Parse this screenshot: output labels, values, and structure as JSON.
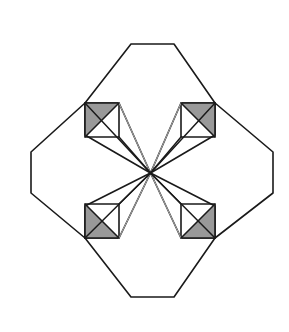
{
  "figure": {
    "canvas": {
      "width": 289,
      "height": 332,
      "background": "#ffffff"
    },
    "center": {
      "x": 150.5,
      "y": 173.0,
      "label": "center-point"
    },
    "colors": {
      "outline": "#1a1a1a",
      "shade_fill": "#999999",
      "shade_fill_light": "#a8a8a8",
      "axis_line": "#b0b0b0",
      "faint_ray": "#cfcfcf",
      "background": "#ffffff"
    },
    "stroke_widths": {
      "outline": 1.6,
      "ray": 1.5,
      "axis": 0.7,
      "faint_ray": 0.8
    },
    "symmetry": {
      "order": 4,
      "type": "4-fold rotational / bilateral"
    },
    "lobes": [
      {
        "name": "top-lobe",
        "outline_points": "131,44 174,44 215,103 181,103 150.5,173 119,103 85,103"
      },
      {
        "name": "right-lobe",
        "outline_points": "273,152 273,193 215,238 215,206 150.5,173 215,135 215,103"
      },
      {
        "name": "bottom-lobe",
        "outline_points": "174,297 131,297 85,238 119,238 150.5,173 181,238 215,238"
      },
      {
        "name": "left-lobe",
        "outline_points": "31,193 31,152 85,103 85,135 150.5,173 85,206 85,238"
      }
    ],
    "squares": [
      {
        "name": "square-top-left",
        "x": 85,
        "y": 103,
        "size": 34,
        "square_points": "85,103 119,103 119,137 85,137",
        "diagonal": "119,103 85,137",
        "shaded_triangle": "85,103 119,103 85,137",
        "shaded_corner": "upper-left"
      },
      {
        "name": "square-top-right",
        "x": 181,
        "y": 103,
        "size": 34,
        "square_points": "181,103 215,103 215,137 181,137",
        "diagonal": "181,103 215,137",
        "shaded_triangle": "181,103 215,103 215,137",
        "shaded_corner": "upper-right"
      },
      {
        "name": "square-bottom-left",
        "x": 85,
        "y": 204,
        "size": 34,
        "square_points": "85,204 119,204 119,238 85,238",
        "diagonal": "85,204 119,238",
        "shaded_triangle": "85,204 85,238 119,238",
        "shaded_corner": "lower-left"
      },
      {
        "name": "square-bottom-right",
        "x": 181,
        "y": 204,
        "size": 34,
        "square_points": "181,204 215,204 215,238 181,238",
        "diagonal": "215,204 181,238",
        "shaded_triangle": "215,204 215,238 181,238",
        "shaded_corner": "lower-right"
      }
    ],
    "rays": [
      {
        "name": "ray-to-tl-outer",
        "x2": 85,
        "y2": 103,
        "weight": "heavy"
      },
      {
        "name": "ray-to-tl-inner",
        "x2": 119,
        "y2": 137,
        "weight": "heavy"
      },
      {
        "name": "ray-to-tl-corner",
        "x2": 119,
        "y2": 103,
        "weight": "faint"
      },
      {
        "name": "ray-to-tr-outer",
        "x2": 215,
        "y2": 103,
        "weight": "heavy"
      },
      {
        "name": "ray-to-tr-inner",
        "x2": 181,
        "y2": 137,
        "weight": "heavy"
      },
      {
        "name": "ray-to-tr-corner",
        "x2": 181,
        "y2": 103,
        "weight": "faint"
      },
      {
        "name": "ray-to-bl-outer",
        "x2": 85,
        "y2": 238,
        "weight": "heavy"
      },
      {
        "name": "ray-to-bl-inner",
        "x2": 119,
        "y2": 204,
        "weight": "heavy"
      },
      {
        "name": "ray-to-bl-corner",
        "x2": 119,
        "y2": 238,
        "weight": "faint"
      },
      {
        "name": "ray-to-br-outer",
        "x2": 215,
        "y2": 238,
        "weight": "heavy"
      },
      {
        "name": "ray-to-br-inner",
        "x2": 181,
        "y2": 204,
        "weight": "heavy"
      },
      {
        "name": "ray-to-br-corner",
        "x2": 181,
        "y2": 238,
        "weight": "faint"
      }
    ],
    "axes": [
      {
        "name": "vertical-axis",
        "x1": 150.5,
        "y1": 44,
        "x2": 150.5,
        "y2": 297
      },
      {
        "name": "horizontal-axis",
        "x1": 31,
        "y1": 173,
        "x2": 273,
        "y2": 173
      }
    ]
  }
}
